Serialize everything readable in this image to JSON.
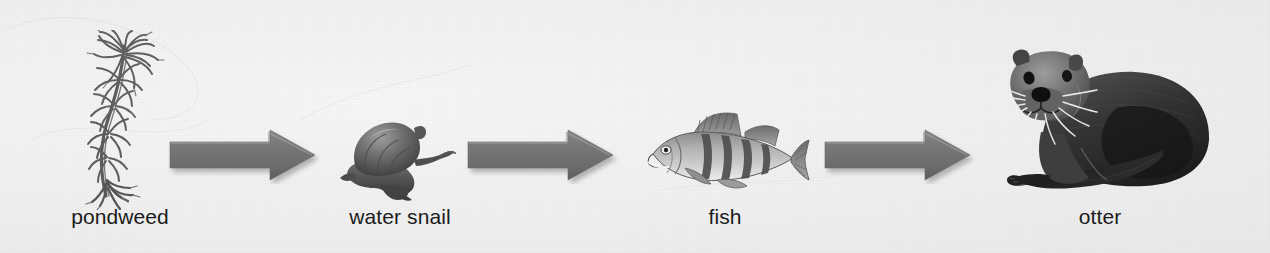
{
  "diagram": {
    "background_color": "#f1f1f1",
    "arrow_color": "#6f6f6f",
    "text_color": "#1b1b1b",
    "direction": "left-to-right",
    "nodes": [
      {
        "id": "pondweed",
        "label": "pondweed",
        "icon": "pondweed-illustration",
        "trophic_level": "producer"
      },
      {
        "id": "water-snail",
        "label": "water snail",
        "icon": "water-snail-illustration",
        "trophic_level": "primary-consumer"
      },
      {
        "id": "fish",
        "label": "fish",
        "icon": "fish-illustration",
        "trophic_level": "secondary-consumer"
      },
      {
        "id": "otter",
        "label": "otter",
        "icon": "otter-illustration",
        "trophic_level": "tertiary-consumer"
      }
    ],
    "arrows": [
      {
        "id": "arrow-1",
        "from": "pondweed",
        "to": "water-snail",
        "glyph": "right-arrow"
      },
      {
        "id": "arrow-2",
        "from": "water-snail",
        "to": "fish",
        "glyph": "right-arrow"
      },
      {
        "id": "arrow-3",
        "from": "fish",
        "to": "otter",
        "glyph": "right-arrow"
      }
    ]
  }
}
